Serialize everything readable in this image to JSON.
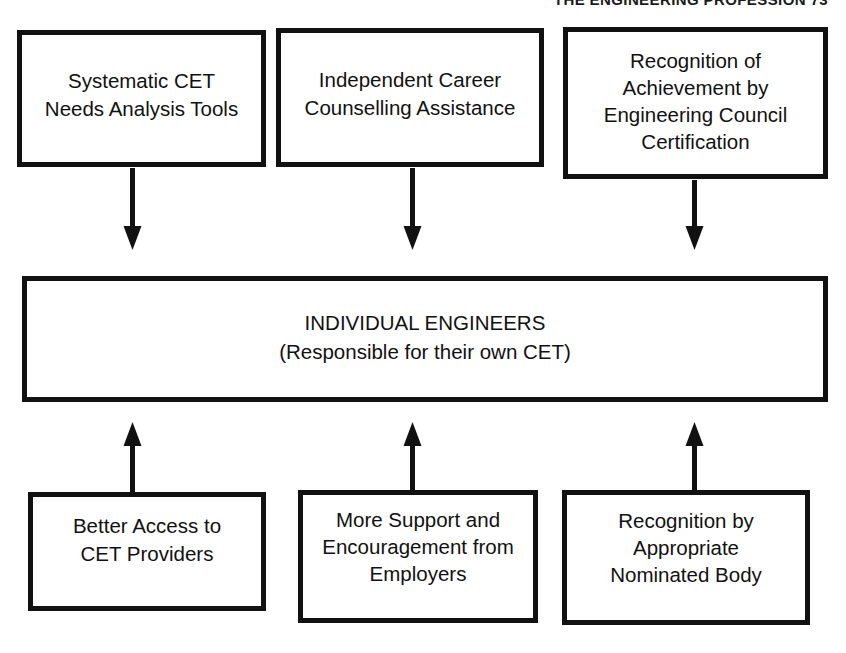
{
  "page": {
    "running_header": "THE ENGINEERING PROFESSION 73",
    "background_color": "#ffffff",
    "ink_color": "#111111"
  },
  "diagram": {
    "type": "flowchart",
    "top_row": [
      {
        "id": "needs-analysis",
        "label": "Systematic CET\nNeeds Analysis  Tools"
      },
      {
        "id": "career-counselling",
        "label": "Independent Career\nCounselling  Assistance"
      },
      {
        "id": "recognition-engineering-council",
        "label": "Recognition of\nAchievement by\nEngineering Council\nCertification"
      }
    ],
    "centre": {
      "id": "individual-engineers",
      "label": "INDIVIDUAL ENGINEERS\n(Responsible  for their own CET)"
    },
    "bottom_row": [
      {
        "id": "better-access",
        "label": "Better Access to\nCET Providers"
      },
      {
        "id": "more-support",
        "label": "More Support and\nEncouragement  from\nEmployers"
      },
      {
        "id": "recognition-nominated-body",
        "label": "Recognition by\nAppropriate\nNominated Body"
      }
    ],
    "connectors": [
      {
        "id": "arrow-down-1",
        "direction": "down",
        "from": "needs-analysis",
        "to": "individual-engineers"
      },
      {
        "id": "arrow-down-2",
        "direction": "down",
        "from": "career-counselling",
        "to": "individual-engineers"
      },
      {
        "id": "arrow-down-3",
        "direction": "down",
        "from": "recognition-engineering-council",
        "to": "individual-engineers"
      },
      {
        "id": "arrow-up-1",
        "direction": "up",
        "from": "better-access",
        "to": "individual-engineers"
      },
      {
        "id": "arrow-up-2",
        "direction": "up",
        "from": "more-support",
        "to": "individual-engineers"
      },
      {
        "id": "arrow-up-3",
        "direction": "up",
        "from": "recognition-nominated-body",
        "to": "individual-engineers"
      }
    ]
  }
}
